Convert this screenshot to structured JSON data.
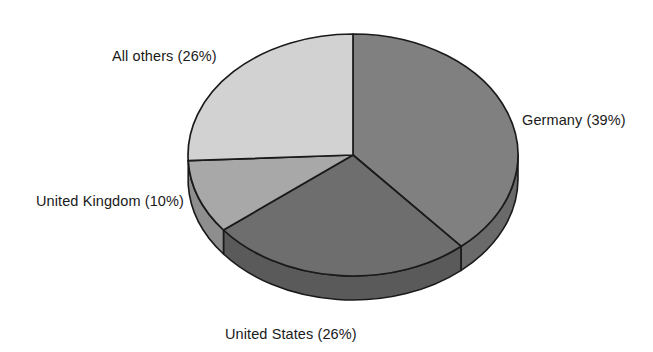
{
  "chart_data": {
    "type": "pie",
    "title": "",
    "subtitle": "",
    "xlabel": "",
    "ylabel": "",
    "legend_position": "none",
    "grid": false,
    "style": "3d-exploded-none",
    "units": "percent",
    "categories": [
      "Germany",
      "United States",
      "United Kingdom",
      "All others"
    ],
    "values": [
      39,
      26,
      10,
      26
    ],
    "labels": [
      "Germany (39%)",
      "United States (26%)",
      "United Kingdom (10%)",
      "All others (26%)"
    ],
    "slices": [
      {
        "name": "Germany",
        "label": "Germany (39%)",
        "value": 39,
        "percent": "39%",
        "color": "#808080",
        "side_color": "#6a6a6a",
        "start_angle_deg": 0,
        "end_angle_deg": 140.4
      },
      {
        "name": "United States",
        "label": "United States (26%)",
        "value": 26,
        "percent": "26%",
        "color": "#6e6e6e",
        "side_color": "#5a5a5a",
        "start_angle_deg": 140.4,
        "end_angle_deg": 234.0
      },
      {
        "name": "United Kingdom",
        "label": "United Kingdom (10%)",
        "value": 10,
        "percent": "10%",
        "color": "#a8a8a8",
        "side_color": "#8e8e8e",
        "start_angle_deg": 234.0,
        "end_angle_deg": 270.0
      },
      {
        "name": "All others",
        "label": "All others (26%)",
        "value": 26,
        "percent": "26%",
        "color": "#d2d2d2",
        "side_color": "#b4b4b4",
        "start_angle_deg": 270.0,
        "end_angle_deg": 360.0
      }
    ],
    "colors": {
      "background": "#ffffff",
      "outline": "#1a1a1a",
      "text": "#1a1a1a"
    }
  }
}
